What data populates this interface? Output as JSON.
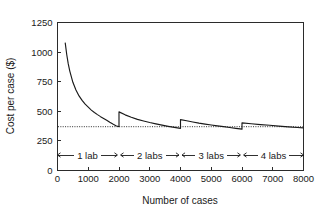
{
  "chart_data": {
    "type": "line",
    "title": "",
    "subtitle": "",
    "xlabel": "Number of cases",
    "ylabel": "Cost per case ($)",
    "xlim": [
      0,
      8000
    ],
    "ylim": [
      0,
      1250
    ],
    "xticks": [
      0,
      1000,
      2000,
      3000,
      4000,
      5000,
      6000,
      7000,
      8000
    ],
    "xtick_labels": [
      "0",
      "1000",
      "2000",
      "3000",
      "4000",
      "5000",
      "6000",
      "7000",
      "8000"
    ],
    "yticks": [
      0,
      250,
      500,
      750,
      1000,
      1250
    ],
    "ytick_labels": [
      "0",
      "250",
      "500",
      "750",
      "1000",
      "1250"
    ],
    "grid": false,
    "legend": false,
    "legend_position": "none",
    "series": [
      {
        "name": "Cost per case",
        "style": "solid-line",
        "color": "#1a1a1a",
        "description": "Piecewise hyperbolic decay; cost jumps upward each time an additional lab is added",
        "points": [
          {
            "x": 250,
            "y": 1080
          },
          {
            "x": 300,
            "y": 980
          },
          {
            "x": 350,
            "y": 900
          },
          {
            "x": 400,
            "y": 840
          },
          {
            "x": 500,
            "y": 745
          },
          {
            "x": 600,
            "y": 680
          },
          {
            "x": 700,
            "y": 630
          },
          {
            "x": 800,
            "y": 592
          },
          {
            "x": 900,
            "y": 560
          },
          {
            "x": 1000,
            "y": 535
          },
          {
            "x": 1100,
            "y": 510
          },
          {
            "x": 1200,
            "y": 490
          },
          {
            "x": 1300,
            "y": 472
          },
          {
            "x": 1400,
            "y": 455
          },
          {
            "x": 1500,
            "y": 440
          },
          {
            "x": 1600,
            "y": 425
          },
          {
            "x": 1700,
            "y": 408
          },
          {
            "x": 1800,
            "y": 392
          },
          {
            "x": 1900,
            "y": 378
          },
          {
            "x": 2000,
            "y": 370
          },
          {
            "x": 2000,
            "y": 495
          },
          {
            "x": 2200,
            "y": 470
          },
          {
            "x": 2400,
            "y": 450
          },
          {
            "x": 2600,
            "y": 432
          },
          {
            "x": 2800,
            "y": 418
          },
          {
            "x": 3000,
            "y": 405
          },
          {
            "x": 3200,
            "y": 394
          },
          {
            "x": 3400,
            "y": 383
          },
          {
            "x": 3600,
            "y": 373
          },
          {
            "x": 3800,
            "y": 364
          },
          {
            "x": 4000,
            "y": 356
          },
          {
            "x": 4000,
            "y": 430
          },
          {
            "x": 4200,
            "y": 420
          },
          {
            "x": 4400,
            "y": 410
          },
          {
            "x": 4600,
            "y": 400
          },
          {
            "x": 4800,
            "y": 392
          },
          {
            "x": 5000,
            "y": 384
          },
          {
            "x": 5200,
            "y": 377
          },
          {
            "x": 5400,
            "y": 370
          },
          {
            "x": 5600,
            "y": 363
          },
          {
            "x": 5800,
            "y": 356
          },
          {
            "x": 6000,
            "y": 350
          },
          {
            "x": 6000,
            "y": 402
          },
          {
            "x": 6300,
            "y": 395
          },
          {
            "x": 6600,
            "y": 388
          },
          {
            "x": 6900,
            "y": 382
          },
          {
            "x": 7200,
            "y": 375
          },
          {
            "x": 7500,
            "y": 369
          },
          {
            "x": 7800,
            "y": 363
          },
          {
            "x": 8000,
            "y": 360
          }
        ]
      }
    ],
    "reference_lines": [
      {
        "name": "minimum-cost-reference",
        "orientation": "horizontal",
        "value": 370,
        "style": "dotted",
        "color": "#1a1a1a",
        "label": ""
      }
    ],
    "annotations": {
      "name": "lab-capacity-bands",
      "description": "Double-headed arrow spans below the plot indicating how many labs are required over each range of case volume",
      "bands": [
        {
          "label": "1 lab",
          "x_start": 0,
          "x_end": 1950
        },
        {
          "label": "2 labs",
          "x_start": 2050,
          "x_end": 3950
        },
        {
          "label": "3 labs",
          "x_start": 4050,
          "x_end": 5950
        },
        {
          "label": "4 labs",
          "x_start": 6050,
          "x_end": 8000
        }
      ]
    }
  }
}
